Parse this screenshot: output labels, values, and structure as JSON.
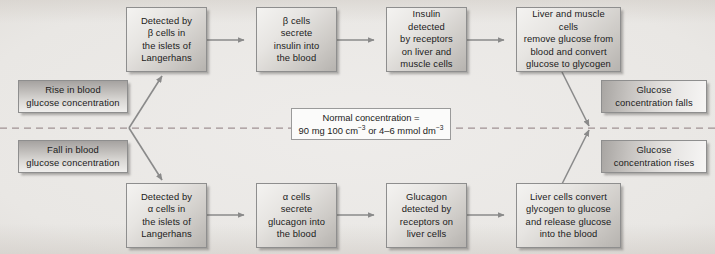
{
  "diagram": {
    "center_line": {
      "style": "dashed",
      "color": "#a09193",
      "label_box": {
        "line1": "Normal concentration =",
        "line2_prefix": "90 mg 100 cm",
        "line2_sup1": "−3",
        "line2_mid": " or 4–6 mmol dm",
        "line2_sup2": "−3"
      }
    },
    "stimuli": [
      {
        "id": "rise",
        "line1": "Rise in blood",
        "line2": "glucose concentration"
      },
      {
        "id": "fall",
        "line1": "Fall in blood",
        "line2": "glucose concentration"
      }
    ],
    "outcomes": [
      {
        "id": "falls",
        "line1": "Glucose",
        "line2": "concentration falls"
      },
      {
        "id": "rises",
        "line1": "Glucose",
        "line2": "concentration rises"
      }
    ],
    "top_pathway": {
      "name": "insulin-pathway",
      "steps": [
        {
          "id": "detect-beta",
          "lines": [
            "Detected by",
            "β cells in",
            "the islets of",
            "Langerhans"
          ]
        },
        {
          "id": "secrete-insulin",
          "lines": [
            "β cells",
            "secrete",
            "insulin into",
            "the blood"
          ]
        },
        {
          "id": "insulin-receptors",
          "lines": [
            "Insulin detected",
            "by receptors",
            "on liver and",
            "muscle cells"
          ]
        },
        {
          "id": "store-glycogen",
          "lines": [
            "Liver and muscle cells",
            "remove glucose from",
            "blood and convert",
            "glucose to glycogen"
          ]
        }
      ]
    },
    "bottom_pathway": {
      "name": "glucagon-pathway",
      "steps": [
        {
          "id": "detect-alpha",
          "lines": [
            "Detected by",
            "α cells in",
            "the islets of",
            "Langerhans"
          ]
        },
        {
          "id": "secrete-glucagon",
          "lines": [
            "α cells",
            "secrete",
            "glucagon into",
            "the blood"
          ]
        },
        {
          "id": "glucagon-receptors",
          "lines": [
            "Glucagon",
            "detected by",
            "receptors on",
            "liver cells"
          ]
        },
        {
          "id": "release-glucose",
          "lines": [
            "Liver cells convert",
            "glycogen to glucose",
            "and release glucose",
            "into the blood"
          ]
        }
      ]
    },
    "colors": {
      "arrow": "#8a8a8a",
      "box_border": "#8e8e8e",
      "dashed_line": "#a09193",
      "text": "#1b1b1b",
      "background": "#e9e7e4"
    }
  }
}
